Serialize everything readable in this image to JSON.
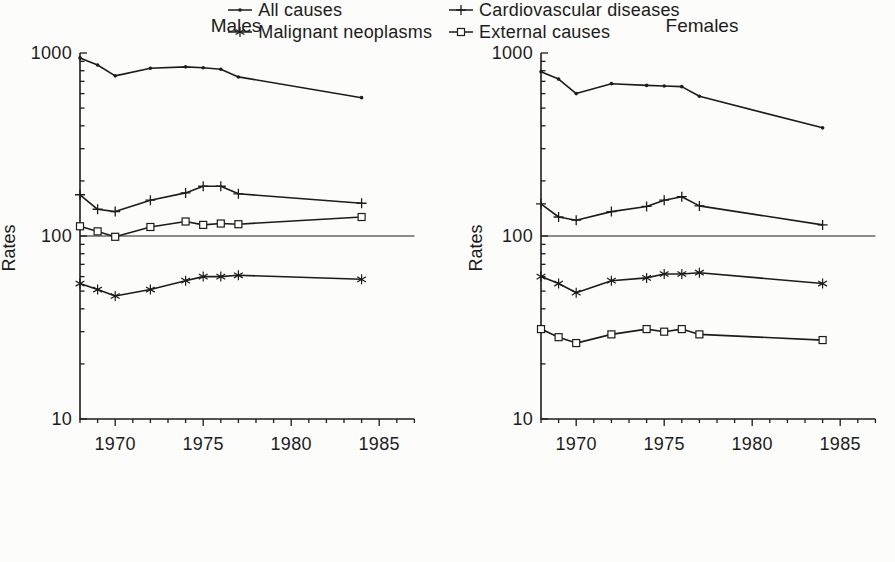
{
  "colors": {
    "ink": "#1c1c1c",
    "background": "#fcfcfa",
    "marker_fill": "#ffffff"
  },
  "legend": {
    "position": "bottom",
    "items": [
      {
        "label": "All causes",
        "marker": "dot"
      },
      {
        "label": "Cardiovascular diseases",
        "marker": "plus"
      },
      {
        "label": "Malignant neoplasms",
        "marker": "asterisk"
      },
      {
        "label": "External causes",
        "marker": "square"
      }
    ]
  },
  "chart_data": [
    {
      "type": "line",
      "title": "Males",
      "xlabel": "",
      "ylabel": "Rates",
      "y_scale": "log",
      "y_range": [
        10,
        1000
      ],
      "y_tick_labels": [
        1000,
        100,
        10
      ],
      "x_range": [
        1968,
        1987
      ],
      "x_tick_labels": [
        1970,
        1975,
        1980,
        1985
      ],
      "reference_line_y": 100,
      "grid": "off",
      "x": [
        1968,
        1969,
        1970,
        1972,
        1974,
        1975,
        1976,
        1977,
        1984
      ],
      "series": [
        {
          "name": "All causes",
          "marker": "dot",
          "values": [
            940,
            860,
            750,
            825,
            840,
            830,
            815,
            740,
            570
          ]
        },
        {
          "name": "Cardiovascular diseases",
          "marker": "plus",
          "values": [
            168,
            140,
            136,
            157,
            172,
            187,
            187,
            170,
            151
          ]
        },
        {
          "name": "External causes",
          "marker": "square",
          "values": [
            113,
            106,
            99,
            112,
            120,
            115,
            117,
            116,
            127
          ]
        },
        {
          "name": "Malignant neoplasms",
          "marker": "asterisk",
          "values": [
            55,
            51,
            47,
            51,
            57,
            60,
            60,
            61,
            58
          ]
        }
      ]
    },
    {
      "type": "line",
      "title": "Females",
      "xlabel": "",
      "ylabel": "Rates",
      "y_scale": "log",
      "y_range": [
        10,
        1000
      ],
      "y_tick_labels": [
        1000,
        100,
        10
      ],
      "x_range": [
        1968,
        1987
      ],
      "x_tick_labels": [
        1970,
        1975,
        1980,
        1985
      ],
      "reference_line_y": 100,
      "grid": "off",
      "x": [
        1968,
        1969,
        1970,
        1972,
        1974,
        1975,
        1976,
        1977,
        1984
      ],
      "series": [
        {
          "name": "All causes",
          "marker": "dot",
          "values": [
            790,
            720,
            600,
            680,
            665,
            660,
            655,
            580,
            390
          ]
        },
        {
          "name": "Cardiovascular diseases",
          "marker": "plus",
          "values": [
            150,
            127,
            122,
            136,
            145,
            157,
            164,
            146,
            115
          ]
        },
        {
          "name": "Malignant neoplasms",
          "marker": "asterisk",
          "values": [
            60,
            55,
            49,
            57,
            59,
            62,
            62,
            63,
            55
          ]
        },
        {
          "name": "External causes",
          "marker": "square",
          "values": [
            31,
            28,
            26,
            29,
            31,
            30,
            31,
            29,
            27
          ]
        }
      ]
    }
  ]
}
